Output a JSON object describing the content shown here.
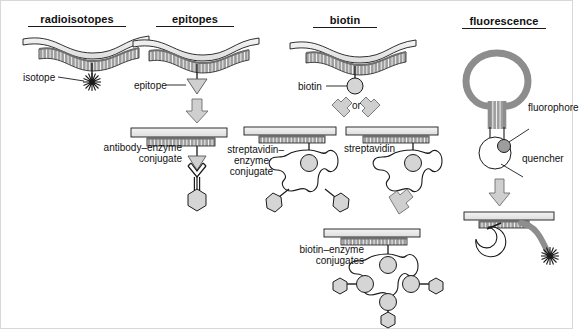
{
  "figure": {
    "kind": "scientific-diagram",
    "background_color": "#ffffff",
    "colors": {
      "outline": "#1a1a1a",
      "slab_fill": "#e8e8e8",
      "hatch_fill": "#9a9a9a",
      "strand_gray": "#8d8d8d",
      "shape_fill": "#d5d5d5",
      "arrow_fill": "#cfcfcf",
      "circle_fill": "#d0d0d0",
      "dark_dot": "#7d7d7d"
    }
  },
  "columns": [
    {
      "id": "radioisotopes",
      "title": "radioisotopes",
      "labels": [
        {
          "id": "isotope",
          "text": "isotope"
        }
      ]
    },
    {
      "id": "epitopes",
      "title": "epitopes",
      "labels": [
        {
          "id": "epitope",
          "text": "epitope"
        },
        {
          "id": "antibody-enzyme-conjugate",
          "text": "antibody–enzyme\nconjugate",
          "line1": "antibody–enzyme",
          "line2": "conjugate"
        }
      ]
    },
    {
      "id": "biotin",
      "title": "biotin",
      "labels": [
        {
          "id": "biotin",
          "text": "biotin"
        },
        {
          "id": "or",
          "text": "or"
        },
        {
          "id": "streptavidin-enzyme-conjugate",
          "line1": "streptavidin–",
          "line2": "enzyme",
          "line3": "conjugate"
        },
        {
          "id": "streptavidin",
          "text": "streptavidin"
        },
        {
          "id": "biotin-enzyme-conjugates",
          "line1": "biotin–enzyme",
          "line2": "conjugates"
        }
      ]
    },
    {
      "id": "fluorescence",
      "title": "fluorescence",
      "labels": [
        {
          "id": "fluorophore",
          "text": "fluorophore"
        },
        {
          "id": "quencher",
          "text": "quencher"
        }
      ]
    }
  ],
  "titles": {
    "radioisotopes": "radioisotopes",
    "epitopes": "epitopes",
    "biotin": "biotin",
    "fluorescence": "fluorescence"
  },
  "text": {
    "isotope": "isotope",
    "epitope": "epitope",
    "antibody_enzyme_1": "antibody–enzyme",
    "antibody_enzyme_2": "conjugate",
    "biotin": "biotin",
    "or": "or",
    "strep_enzyme_1": "streptavidin–",
    "strep_enzyme_2": "enzyme",
    "strep_enzyme_3": "conjugate",
    "streptavidin": "streptavidin",
    "biotin_enzyme_1": "biotin–enzyme",
    "biotin_enzyme_2": "conjugates",
    "fluorophore": "fluorophore",
    "quencher": "quencher"
  }
}
